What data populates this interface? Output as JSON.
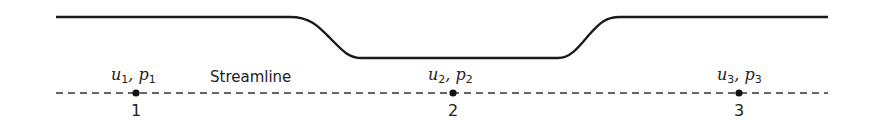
{
  "diagram": {
    "type": "venturi-streamline",
    "wall_color": "#1a1a1a",
    "streamline_color": "#333333",
    "streamline_label": "Streamline",
    "points": [
      {
        "id": "1",
        "u_label": "u",
        "u_sub": "1",
        "p_label": "p",
        "p_sub": "1",
        "separator": ",",
        "x": 136
      },
      {
        "id": "2",
        "u_label": "u",
        "u_sub": "2",
        "p_label": "p",
        "p_sub": "2",
        "separator": ",",
        "x": 453
      },
      {
        "id": "3",
        "u_label": "u",
        "u_sub": "3",
        "p_label": "p",
        "p_sub": "3",
        "separator": ",",
        "x": 739
      }
    ]
  }
}
